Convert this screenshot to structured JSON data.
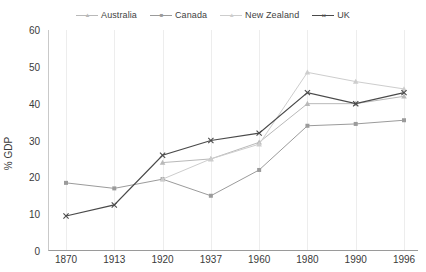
{
  "chart_data": {
    "type": "line",
    "title": "",
    "xlabel": "",
    "ylabel": "% GDP",
    "categories": [
      "1870",
      "1913",
      "1920",
      "1937",
      "1960",
      "1980",
      "1990",
      "1996"
    ],
    "ylim": [
      0,
      60
    ],
    "yticks": [
      0,
      10,
      20,
      30,
      40,
      50,
      60
    ],
    "grid": "vertical",
    "legend_position": "top-center",
    "series": [
      {
        "name": "Australia",
        "color": "#b9b9b9",
        "marker": "triangle",
        "values": [
          null,
          null,
          24.0,
          25.0,
          29.5,
          40.0,
          40.0,
          42.0
        ]
      },
      {
        "name": "Canada",
        "color": "#9b9b9b",
        "marker": "square",
        "values": [
          18.5,
          17.0,
          19.5,
          15.0,
          22.0,
          34.0,
          34.5,
          35.5
        ]
      },
      {
        "name": "New Zealand",
        "color": "#cdcdcd",
        "marker": "triangle",
        "values": [
          null,
          null,
          19.5,
          25.0,
          29.0,
          48.5,
          46.0,
          44.0
        ]
      },
      {
        "name": "UK",
        "color": "#4a4a4a",
        "marker": "cross",
        "values": [
          9.5,
          12.5,
          26.0,
          30.0,
          32.0,
          43.0,
          40.0,
          43.0
        ]
      }
    ]
  },
  "legend": {
    "items": [
      {
        "label": "Australia",
        "icon": "line-marker-triangle-icon"
      },
      {
        "label": "Canada",
        "icon": "line-marker-square-icon"
      },
      {
        "label": "New Zealand",
        "icon": "line-marker-triangle-icon"
      },
      {
        "label": "UK",
        "icon": "line-marker-cross-icon"
      }
    ]
  },
  "axes": {
    "y_title": "% GDP",
    "y_ticks": [
      "0",
      "10",
      "20",
      "30",
      "40",
      "50",
      "60"
    ],
    "x_ticks": [
      "1870",
      "1913",
      "1920",
      "1937",
      "1960",
      "1980",
      "1990",
      "1996"
    ]
  }
}
